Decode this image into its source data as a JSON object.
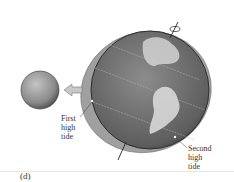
{
  "figure": {
    "panel_label": "(d)",
    "labels": {
      "first_high_tide": [
        "First",
        "high",
        "tide"
      ],
      "second_high_tide": [
        "Second",
        "high",
        "tide"
      ]
    },
    "objects": [
      "moon",
      "earth",
      "tidal-bulge",
      "rotation-axis",
      "force-arrow"
    ],
    "colors": {
      "ocean_bulge": "#9a9a9a",
      "earth": "#6e6e6e",
      "moon": "#8a8a8a",
      "land": "#d8d8d8",
      "arrow": "#b0b0b0"
    }
  }
}
